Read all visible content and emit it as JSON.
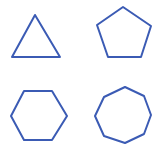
{
  "canvas": {
    "width": 158,
    "height": 151,
    "background": "#ffffff"
  },
  "style": {
    "stroke": "#3b5bb4",
    "stroke_width": 2,
    "fill": "none"
  },
  "shapes": [
    {
      "name": "triangle",
      "sides": 3,
      "points": "35,15 60,57 12,57"
    },
    {
      "name": "pentagon",
      "sides": 5,
      "points": "123,7 151,26 141,57 108,57 97,25"
    },
    {
      "name": "hexagon",
      "sides": 6,
      "points": "24,91 52,91 67,116 52,140 24,140 11,116"
    },
    {
      "name": "octagon",
      "sides": 8,
      "points": "125,87 144,96 151,115 144,134 125,143 104,136 95,116 104,97"
    }
  ]
}
